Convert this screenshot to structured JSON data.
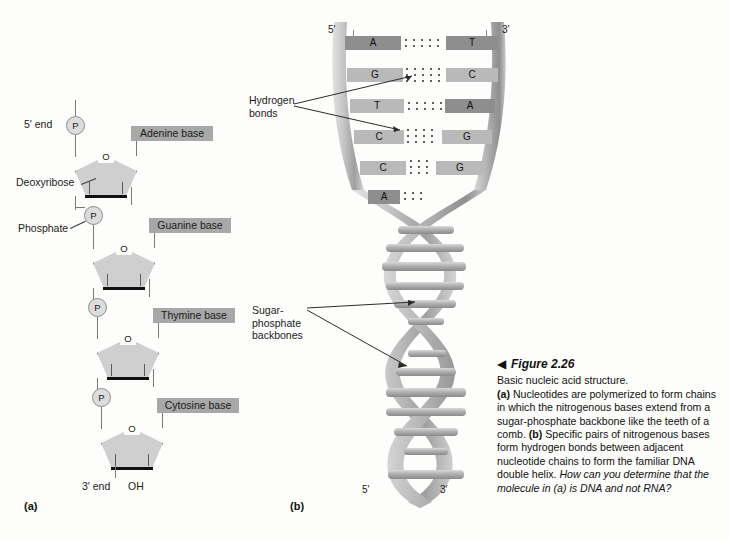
{
  "figure": {
    "number": "Figure 2.26",
    "arrow_glyph": "◀",
    "subtitle": "Basic nucleic acid structure.",
    "caption_a_tag": "(a)",
    "caption_a_text": " Nucleotides are polymerized to form chains in which the nitrogenous bases extend from a sugar-phosphate backbone like the teeth of a comb. ",
    "caption_b_tag": "(b)",
    "caption_b_text": " Specific pairs of nitrogenous bases form hydrogen bonds between adjacent nucleotide chains to form the familiar DNA double helix. ",
    "caption_question": "How can you determine that the molecule in (a) is DNA and not RNA?"
  },
  "panel_a": {
    "tag": "(a)",
    "end_5": "5′ end",
    "end_3": "3′ end",
    "hydroxyl": "OH",
    "phosphate_glyph": "P",
    "oxygen_glyph": "O",
    "callouts": [
      {
        "name": "deoxyribose",
        "label": "Deoxyribose"
      },
      {
        "name": "phosphate",
        "label": "Phosphate"
      }
    ],
    "nucleotides": [
      {
        "base_label": "Adenine base",
        "base": "A"
      },
      {
        "base_label": "Guanine base",
        "base": "G"
      },
      {
        "base_label": "Thymine base",
        "base": "T"
      },
      {
        "base_label": "Cytosine base",
        "base": "C"
      }
    ]
  },
  "panel_b": {
    "tag": "(b)",
    "top_left_prime": "5′",
    "top_right_prime": "3′",
    "bottom_left_prime": "5′",
    "bottom_right_prime": "3′",
    "callouts": [
      {
        "name": "hydrogen-bonds",
        "label": "Hydrogen\nbonds"
      },
      {
        "name": "sugar-phosphate-backbones",
        "label": "Sugar-\nphosphate\nbackbones"
      }
    ],
    "base_pairs": [
      {
        "left": "A",
        "right": "T",
        "bonds": 2
      },
      {
        "left": "G",
        "right": "C",
        "bonds": 3
      },
      {
        "left": "T",
        "right": "A",
        "bonds": 2
      },
      {
        "left": "C",
        "right": "G",
        "bonds": 3
      },
      {
        "left": "C",
        "right": "G",
        "bonds": 3
      },
      {
        "left": "A",
        "right": "",
        "bonds": 2
      }
    ]
  },
  "colors": {
    "page_background": "#fdfdfb",
    "base_box_gray": "#a8a8a8",
    "base_dark_gray": "#8e8e8e",
    "base_light_gray": "#b9b9b9",
    "sugar_fill": "#cfcfcf",
    "phosphate_fill": "#dcdcdc",
    "helix_ribbon": "#bcbcbc",
    "line_gray": "#7a7a7a",
    "text": "#1b1b1b"
  }
}
